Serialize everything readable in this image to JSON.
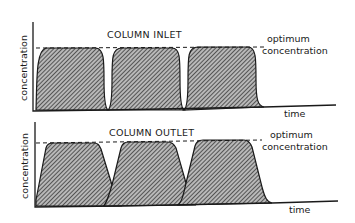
{
  "panels": [
    {
      "title": "COLUMN INLET",
      "y_label": "concentration",
      "x_label": "time",
      "reference_line": {
        "label_line1": "optimum",
        "label_line2": "concentration"
      },
      "peak_shape": "rectangular (sharp rise/fall, rounded corners)",
      "peak_count": 3
    },
    {
      "title": "COLUMN OUTLET",
      "y_label": "concentration",
      "x_label": "time",
      "reference_line": {
        "label_line1": "optimum",
        "label_line2": "concentration"
      },
      "peak_shape": "trapezoidal (broadened, overlapping tails)",
      "peak_count": 3
    }
  ],
  "colors": {
    "ink": "#1a1a1a",
    "background": "#ffffff"
  }
}
